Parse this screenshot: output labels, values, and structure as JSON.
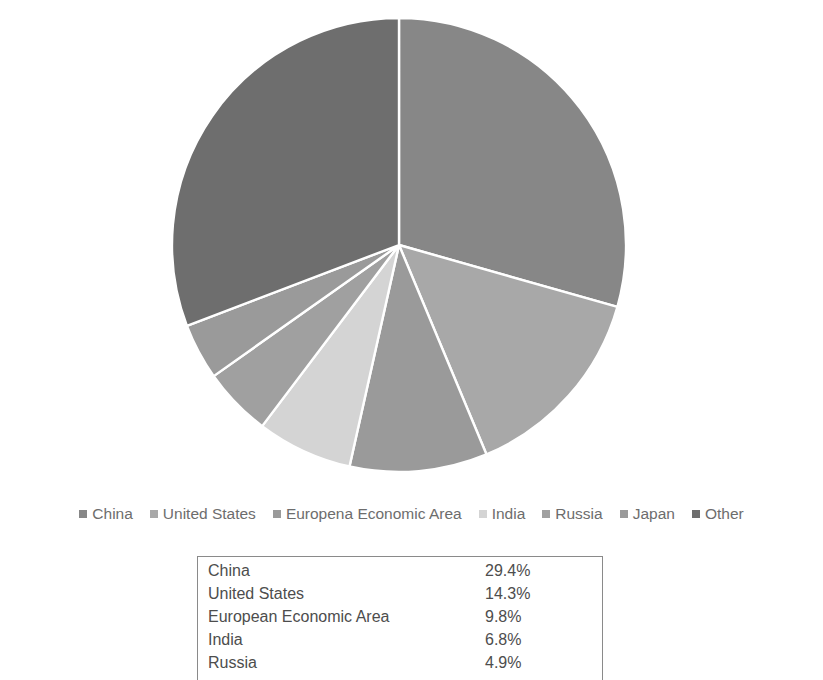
{
  "chart_title": "",
  "chart_data": {
    "type": "pie",
    "title": "",
    "categories": [
      "China",
      "United States",
      "Europena Economic Area",
      "India",
      "Russia",
      "Japan",
      "Other"
    ],
    "values": [
      29.4,
      14.3,
      9.8,
      6.8,
      4.9,
      4.0,
      30.8
    ],
    "unit": "%",
    "start_angle_deg": 0,
    "direction": "clockwise",
    "legend_position": "bottom",
    "colors": [
      "#878787",
      "#a8a8a8",
      "#9a9a9a",
      "#d4d4d4",
      "#a0a0a0",
      "#9a9a9a",
      "#6e6e6e"
    ],
    "slice_border_color": "#ffffff",
    "center_x": 399,
    "center_y": 245,
    "radius": 227
  },
  "legend": {
    "items": [
      {
        "label": "China",
        "color": "#878787"
      },
      {
        "label": "United States",
        "color": "#a8a8a8"
      },
      {
        "label": "Europena Economic Area",
        "color": "#9a9a9a"
      },
      {
        "label": "India",
        "color": "#d4d4d4"
      },
      {
        "label": "Russia",
        "color": "#a0a0a0"
      },
      {
        "label": "Japan",
        "color": "#9a9a9a"
      },
      {
        "label": "Other",
        "color": "#6e6e6e"
      }
    ]
  },
  "table": {
    "rows": [
      {
        "name": "China",
        "value": "29.4%"
      },
      {
        "name": "United States",
        "value": "14.3%"
      },
      {
        "name": "European Economic Area",
        "value": "9.8%"
      },
      {
        "name": "India",
        "value": "6.8%"
      },
      {
        "name": "Russia",
        "value": "4.9%"
      }
    ]
  }
}
